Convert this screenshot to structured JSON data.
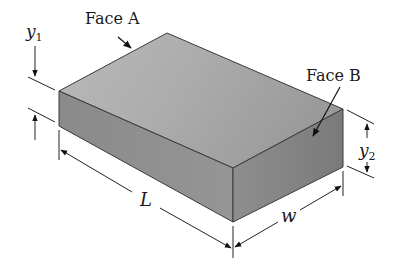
{
  "diagram": {
    "type": "3d-block-dimension-diagram",
    "labels": {
      "face_a": "Face A",
      "face_b": "Face B",
      "y1": "y",
      "y1_sub": "1",
      "y2": "y",
      "y2_sub": "2",
      "length": "L",
      "width": "w"
    },
    "colors": {
      "top_face": "#a6a6a6",
      "left_face": "#8c8c8c",
      "right_face": "#7f7f7f",
      "edge": "#3a3a3a",
      "dim_line": "#222222"
    }
  }
}
